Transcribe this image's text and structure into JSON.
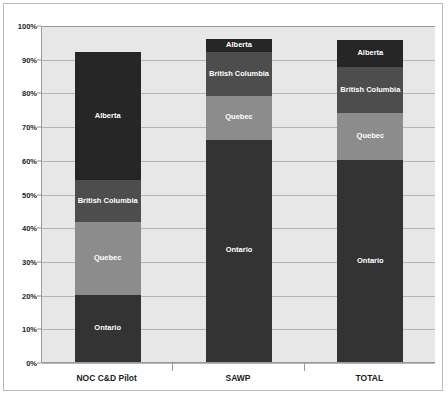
{
  "chart_data": {
    "type": "bar",
    "subtype": "stacked-bar",
    "title": "",
    "xlabel": "",
    "ylabel": "",
    "ylim": [
      0,
      100
    ],
    "ytick_labels": [
      "100%",
      "90%",
      "80%",
      "70%",
      "60%",
      "50%",
      "40%",
      "30%",
      "20%",
      "10%",
      "0%"
    ],
    "ytick_values": [
      100,
      90,
      80,
      70,
      60,
      50,
      40,
      30,
      20,
      10,
      0
    ],
    "grid": true,
    "legend": "none",
    "stack_order_bottom_to_top": [
      "Ontario",
      "Quebec",
      "British Columbia",
      "Alberta"
    ],
    "categories": [
      "NOC C&D Pilot",
      "SAWP",
      "TOTAL"
    ],
    "series": [
      {
        "name": "Ontario",
        "values": [
          20.0,
          66.0,
          60.0
        ],
        "color": "#333333"
      },
      {
        "name": "Quebec",
        "values": [
          21.5,
          13.0,
          14.0
        ],
        "color": "#8c8c8c"
      },
      {
        "name": "British Columbia",
        "values": [
          12.5,
          13.0,
          13.5
        ],
        "color": "#4d4d4d"
      },
      {
        "name": "Alberta",
        "values": [
          38.0,
          4.0,
          8.0
        ],
        "color": "#262626"
      }
    ],
    "bar_totals": [
      92.0,
      96.0,
      95.5
    ]
  },
  "colors": {
    "plot_background": "#e7e7e7",
    "page_background": "#ffffff",
    "gridline": "#b4b4b4",
    "axis_line": "#9a9a9a",
    "frame_border": "#b9b9b9",
    "segment_label_text": "#ffffff",
    "axis_label_text": "#1c1c1c"
  },
  "axis": {
    "y_ticks": [
      {
        "label": "100%",
        "value": 100
      },
      {
        "label": "90%",
        "value": 90
      },
      {
        "label": "80%",
        "value": 80
      },
      {
        "label": "70%",
        "value": 70
      },
      {
        "label": "60%",
        "value": 60
      },
      {
        "label": "50%",
        "value": 50
      },
      {
        "label": "40%",
        "value": 40
      },
      {
        "label": "30%",
        "value": 30
      },
      {
        "label": "20%",
        "value": 20
      },
      {
        "label": "10%",
        "value": 10
      },
      {
        "label": "0%",
        "value": 0
      }
    ],
    "x_categories": [
      {
        "label": "NOC C&D Pilot"
      },
      {
        "label": "SAWP"
      },
      {
        "label": "TOTAL"
      }
    ]
  },
  "bars": [
    {
      "category": "NOC C&D Pilot",
      "segments": [
        {
          "label": "Alberta",
          "value": 38.0,
          "start": 54.0,
          "end": 92.0,
          "color": "#262626"
        },
        {
          "label": "British Columbia",
          "value": 12.5,
          "start": 41.5,
          "end": 54.0,
          "color": "#4d4d4d"
        },
        {
          "label": "Quebec",
          "value": 21.5,
          "start": 20.0,
          "end": 41.5,
          "color": "#8c8c8c"
        },
        {
          "label": "Ontario",
          "value": 20.0,
          "start": 0.0,
          "end": 20.0,
          "color": "#333333"
        }
      ]
    },
    {
      "category": "SAWP",
      "segments": [
        {
          "label": "Alberta",
          "value": 4.0,
          "start": 92.0,
          "end": 96.0,
          "color": "#262626"
        },
        {
          "label": "British Columbia",
          "value": 13.0,
          "start": 79.0,
          "end": 92.0,
          "color": "#4d4d4d"
        },
        {
          "label": "Quebec",
          "value": 13.0,
          "start": 66.0,
          "end": 79.0,
          "color": "#8c8c8c"
        },
        {
          "label": "Ontario",
          "value": 66.0,
          "start": 0.0,
          "end": 66.0,
          "color": "#333333"
        }
      ]
    },
    {
      "category": "TOTAL",
      "segments": [
        {
          "label": "Alberta",
          "value": 8.0,
          "start": 87.5,
          "end": 95.5,
          "color": "#262626"
        },
        {
          "label": "British Columbia",
          "value": 13.5,
          "start": 74.0,
          "end": 87.5,
          "color": "#4d4d4d"
        },
        {
          "label": "Quebec",
          "value": 14.0,
          "start": 60.0,
          "end": 74.0,
          "color": "#8c8c8c"
        },
        {
          "label": "Ontario",
          "value": 60.0,
          "start": 0.0,
          "end": 60.0,
          "color": "#333333"
        }
      ]
    }
  ]
}
